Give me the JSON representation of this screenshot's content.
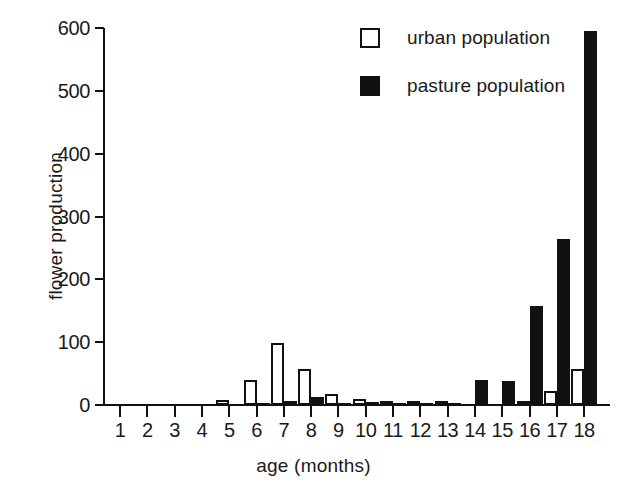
{
  "chart_data": {
    "type": "bar",
    "title": "",
    "xlabel": "age (months)",
    "ylabel": "flower production",
    "categories": [
      "1",
      "2",
      "3",
      "4",
      "5",
      "6",
      "7",
      "8",
      "9",
      "10",
      "11",
      "12",
      "13",
      "14",
      "15",
      "16",
      "17",
      "18"
    ],
    "series": [
      {
        "name": "urban population",
        "style": "open",
        "color": "#ffffff",
        "edge_color": "#111111",
        "values": [
          0,
          0,
          0,
          0,
          8,
          40,
          98,
          57,
          18,
          9,
          6,
          3,
          2,
          0,
          0,
          7,
          22,
          57
        ]
      },
      {
        "name": "pasture population",
        "style": "filled",
        "color": "#111111",
        "edge_color": "#111111",
        "values": [
          0,
          0,
          0,
          0,
          0,
          1,
          7,
          13,
          4,
          5,
          2,
          2,
          2,
          40,
          38,
          158,
          265,
          595
        ]
      }
    ],
    "ylim": [
      0,
      600
    ],
    "yticks": [
      0,
      100,
      200,
      300,
      400,
      500,
      600
    ],
    "ytick_labels": [
      "0",
      "100",
      "200",
      "300",
      "400",
      "500",
      "600"
    ],
    "xticks": [
      "1",
      "2",
      "3",
      "4",
      "5",
      "6",
      "7",
      "8",
      "9",
      "10",
      "11",
      "12",
      "13",
      "14",
      "15",
      "16",
      "17",
      "18"
    ],
    "grid": false,
    "legend_position": "top-right",
    "legend": [
      {
        "label": "urban population",
        "swatch": "open-square"
      },
      {
        "label": "pasture population",
        "swatch": "filled-square"
      }
    ]
  }
}
